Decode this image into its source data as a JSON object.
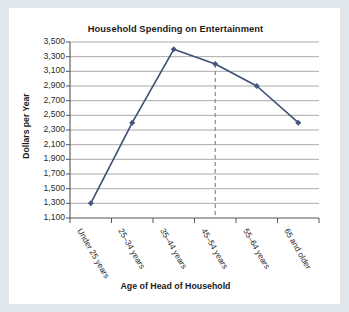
{
  "chart_data": {
    "type": "line",
    "title": "Household Spending on Entertainment",
    "xlabel": "Age of Head of Household",
    "ylabel": "Dollars per Year",
    "categories": [
      "Under 25 years",
      "25–34 years",
      "35–44 years",
      "45–54 years",
      "55–64 years",
      "65 and older"
    ],
    "values": [
      1300,
      2400,
      3400,
      3200,
      2900,
      2400
    ],
    "ylim": [
      1100,
      3500
    ],
    "ytick_labels": [
      "3,500",
      "3,300",
      "3,100",
      "2,900",
      "2,700",
      "2,500",
      "2,300",
      "2,100",
      "1,900",
      "1,700",
      "1,500",
      "1,300",
      "1,100"
    ],
    "ytick_values": [
      3500,
      3300,
      3100,
      2900,
      2700,
      2500,
      2300,
      2100,
      1900,
      1700,
      1500,
      1300,
      1100
    ],
    "ystep": 200,
    "grid": true,
    "legend": "none",
    "annotations": [
      {
        "type": "vertical-dashed-reference-line",
        "at_category": "45–54 years",
        "category_index": 3
      }
    ],
    "series_color": "#3d4f73",
    "grid_color": "#9a9a9a",
    "marker": "diamond"
  },
  "colors": {
    "page_background": "#dfe7ec",
    "card_background": "#ffffff",
    "line": "#3d4f73",
    "marker": "#46577d",
    "gridline": "#a0a0a0",
    "axis": "#555555",
    "text": "#1b1b1b",
    "dashed_reference": "#8a8a8a"
  }
}
